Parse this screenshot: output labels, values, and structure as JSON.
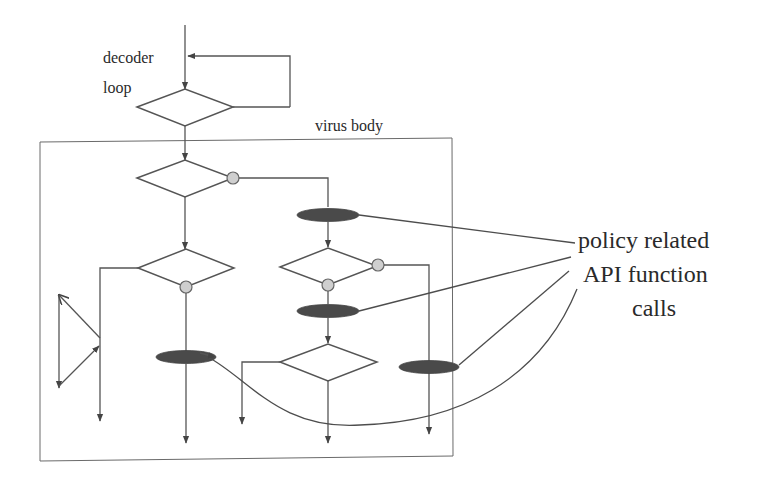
{
  "labels": {
    "decoder_line1": "decoder",
    "decoder_line2": "loop",
    "virus_body": "virus body",
    "annotation_line1": "policy related",
    "annotation_line2": "API function",
    "annotation_line3": "calls"
  },
  "legend": {
    "decision_node": "diamond",
    "branch_point": "grey-circle",
    "api_call_node": "dark-ellipse"
  },
  "colors": {
    "background": "#ffffff",
    "line": "#555555",
    "api_call_fill": "#4a4a4a",
    "branch_dot_fill": "#cfcfcf",
    "text": "#2a2a2a"
  },
  "counts": {
    "decision_nodes": 6,
    "api_call_nodes": 4,
    "branch_dots": 5,
    "annotation_pointers": 4
  }
}
